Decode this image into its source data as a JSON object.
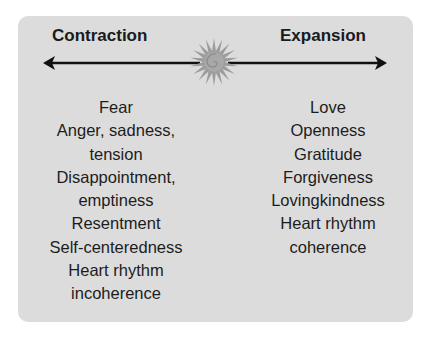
{
  "diagram": {
    "left_heading": "Contraction",
    "right_heading": "Expansion",
    "center_icon": "sun-spiral-icon",
    "colors": {
      "panel": "#dcdcdc",
      "text": "#1a1a1a",
      "arrow": "#111111",
      "sun": "#9a9a9a"
    },
    "left_items": [
      "Fear",
      "Anger, sadness,",
      "tension",
      "Disappointment,",
      "emptiness",
      "Resentment",
      "Self-centeredness",
      "Heart rhythm",
      "incoherence"
    ],
    "right_items": [
      "Love",
      "Openness",
      "Gratitude",
      "Forgiveness",
      "Lovingkindness",
      "Heart rhythm",
      "coherence"
    ]
  }
}
